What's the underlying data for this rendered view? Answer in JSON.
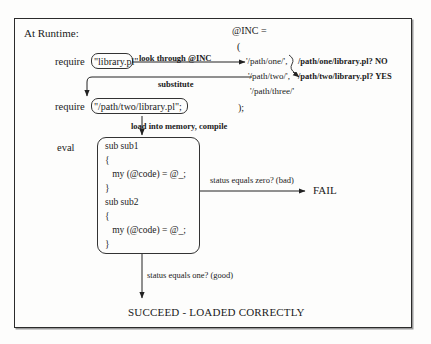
{
  "figure": {
    "title_label": "At Runtime:",
    "require_keyword_1": "require",
    "require_value_1": "\"library.pl\"",
    "edge_look_through": "look through @INC",
    "edge_substitute": "substitute",
    "require_keyword_2": "require",
    "require_value_2": "\"/path/two/library.pl\";",
    "edge_load_compile": "load into memory, compile",
    "eval_keyword": "eval",
    "inc_header": "@INC =",
    "inc_open_paren": "(",
    "inc_entries": [
      "'/path/one/',",
      "'/path/two/',",
      "'/path/three/'"
    ],
    "inc_close_paren": ");",
    "probe_results": [
      "/path/one/library.pl? NO",
      "/path/two/library.pl? YES"
    ],
    "code_lines": [
      "sub sub1",
      "{",
      "   my (@code) = @_;",
      "}",
      "sub sub2",
      "{",
      "   my (@code) = @_;",
      "}"
    ],
    "edge_status_zero": "status equals zero? (bad)",
    "fail_label": "FAIL",
    "edge_status_one": "status equals one? (good)",
    "succeed_label": "SUCCEED - LOADED CORRECTLY"
  }
}
